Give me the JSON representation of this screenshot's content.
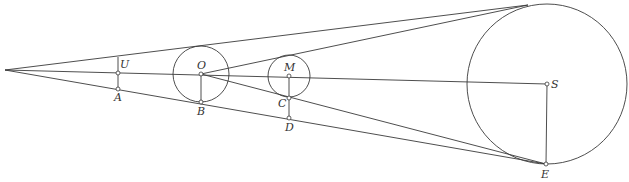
{
  "diagram": {
    "type": "geometric-construction",
    "apex": {
      "x": 5,
      "y": 70
    },
    "tangent_top_point": {
      "x": 528,
      "y": 5
    },
    "circles": [
      {
        "name": "O",
        "cx": 201,
        "cy": 74,
        "r": 28
      },
      {
        "name": "M",
        "cx": 289,
        "cy": 76,
        "r": 21
      },
      {
        "name": "S",
        "cx": 547,
        "cy": 84,
        "r": 80
      }
    ],
    "points": [
      {
        "label": "U",
        "x": 118,
        "y": 73,
        "lx": 120,
        "ly": 68
      },
      {
        "label": "A",
        "x": 118,
        "y": 89,
        "lx": 114,
        "ly": 101
      },
      {
        "label": "O",
        "x": 201,
        "y": 74,
        "lx": 197,
        "ly": 69
      },
      {
        "label": "B",
        "x": 201,
        "y": 102,
        "lx": 197,
        "ly": 115
      },
      {
        "label": "M",
        "x": 289,
        "y": 76,
        "lx": 284,
        "ly": 71
      },
      {
        "label": "C",
        "x": 289,
        "y": 98,
        "lx": 278,
        "ly": 106
      },
      {
        "label": "D",
        "x": 289,
        "y": 118,
        "lx": 285,
        "ly": 131
      },
      {
        "label": "S",
        "x": 547,
        "y": 84,
        "lx": 551,
        "ly": 88
      },
      {
        "label": "E",
        "x": 546,
        "y": 164,
        "lx": 541,
        "ly": 178
      }
    ],
    "labels": {
      "U": "U",
      "A": "A",
      "O": "O",
      "B": "B",
      "M": "M",
      "C": "C",
      "D": "D",
      "S": "S",
      "E": "E"
    },
    "stroke_color": "#3a3a3a",
    "background": "#ffffff"
  }
}
